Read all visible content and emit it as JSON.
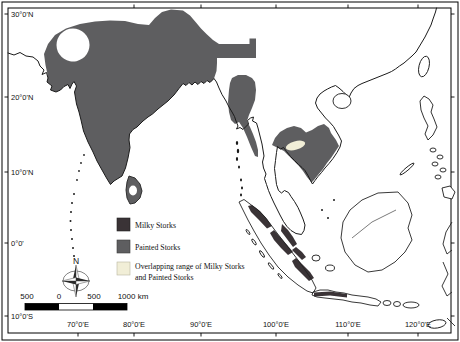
{
  "axes": {
    "lat": [
      "30°0'N",
      "20°0'N",
      "10°0'N",
      "0°0'",
      "10°0'S"
    ],
    "lon": [
      "70°0'E",
      "80°0'E",
      "90°0'E",
      "100°0'E",
      "110°0'E",
      "120°0'E"
    ]
  },
  "legend": {
    "milky": {
      "label": "Milky Storks",
      "color": "#3a3336"
    },
    "painted": {
      "label": "Painted Storks",
      "color": "#5e5e60"
    },
    "overlap": {
      "line1": "Overlapping range of Milky Storks",
      "line2": "and Painted Storks",
      "color": "#f1eed7"
    }
  },
  "scalebar": {
    "labels": [
      "500",
      "0",
      "500",
      "1000 km"
    ]
  },
  "compass": {
    "north_label": "N"
  }
}
